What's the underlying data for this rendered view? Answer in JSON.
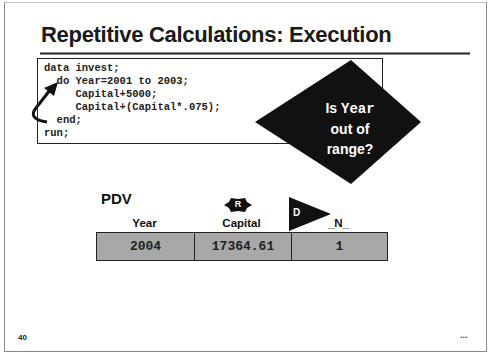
{
  "slide": {
    "title": "Repetitive Calculations: Execution",
    "page_number": "40",
    "more_indicator": "..."
  },
  "code": {
    "lines": [
      "data invest;",
      "  do Year=2001 to 2003;",
      "     Capital+5000;",
      "     Capital+(Capital*.075);",
      "  end;",
      "run;"
    ]
  },
  "decision": {
    "line1_prefix": "Is ",
    "line1_var": "Year",
    "line2": "out of",
    "line3": "range?"
  },
  "pdv": {
    "label": "PDV",
    "columns": [
      {
        "header": "Year",
        "value": "2004",
        "badge": null
      },
      {
        "header": "Capital",
        "value": "17364.61",
        "badge": "R"
      },
      {
        "header": "_N_",
        "value": "1",
        "badge": "D"
      }
    ]
  },
  "colors": {
    "diamond": "#111111",
    "cell_fill": "#a8a8a8",
    "border": "#222222"
  }
}
